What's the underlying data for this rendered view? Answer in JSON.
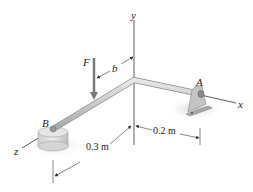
{
  "diagram": {
    "type": "3D statics bent rod",
    "labels": {
      "y_axis": "y",
      "x_axis": "x",
      "z_axis": "z",
      "force": "F",
      "dim_b": "b",
      "point_a": "A",
      "point_b": "B",
      "dim_02": "0.2 m",
      "dim_03": "0.3 m"
    },
    "colors": {
      "rod": "#c8c8c8",
      "rod_edge": "#8a8a8a",
      "axis": "#333333",
      "force_arrow": "#7a7a7a",
      "shadow": "#d6d6d6",
      "support": "#bdbdbd"
    }
  }
}
